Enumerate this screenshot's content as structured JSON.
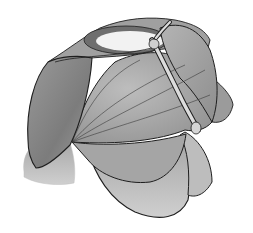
{
  "figure": {
    "colors": {
      "background": "#ffffff",
      "panel_dark": "#8a8a8a",
      "panel_mid": "#a8a8a8",
      "panel_light": "#c4c4c4",
      "oculus": "#f2f2f2",
      "outline": "#1e1e1e",
      "rib": "#d9d9d9"
    }
  }
}
